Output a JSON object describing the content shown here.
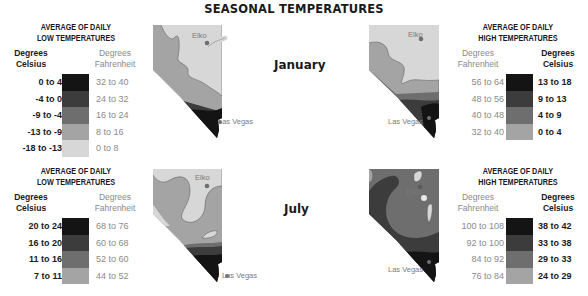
{
  "title": "SEASONAL TEMPERATURES",
  "months": {
    "january": "January",
    "july": "July"
  },
  "cities": {
    "elko": "Elko",
    "las_vegas": "Las Vegas"
  },
  "colors": {
    "level1": "#141414",
    "level2": "#3c3c3c",
    "level3": "#6e6e6e",
    "level4": "#a4a4a4",
    "level5": "#d7d7d7"
  },
  "legends": {
    "jan_low": {
      "title_line1": "AVERAGE OF DAILY",
      "title_line2": "LOW TEMPERATURES",
      "celsius_head1": "Degrees",
      "celsius_head2": "Celsius",
      "fahr_head1": "Degrees",
      "fahr_head2": "Fahrenheit",
      "rows": [
        {
          "c": "0 to 4",
          "f": "32 to 40",
          "color": "#141414"
        },
        {
          "c": "-4 to 0",
          "f": "24 to 32",
          "color": "#3c3c3c"
        },
        {
          "c": "-9 to -4",
          "f": "16 to 24",
          "color": "#6e6e6e"
        },
        {
          "c": "-13 to -9",
          "f": "8 to 16",
          "color": "#a4a4a4"
        },
        {
          "c": "-18 to -13",
          "f": "0 to 8",
          "color": "#d7d7d7"
        }
      ]
    },
    "jan_high": {
      "title_line1": "AVERAGE OF DAILY",
      "title_line2": "HIGH TEMPERATURES",
      "celsius_head1": "Degrees",
      "celsius_head2": "Celsius",
      "fahr_head1": "Degrees",
      "fahr_head2": "Fahrenheit",
      "rows": [
        {
          "c": "13 to 18",
          "f": "56 to 64",
          "color": "#141414"
        },
        {
          "c": "9 to 13",
          "f": "48 to 56",
          "color": "#3c3c3c"
        },
        {
          "c": "4 to 9",
          "f": "40 to 48",
          "color": "#6e6e6e"
        },
        {
          "c": "0 to 4",
          "f": "32 to 40",
          "color": "#a4a4a4"
        }
      ]
    },
    "jul_low": {
      "title_line1": "AVERAGE OF DAILY",
      "title_line2": "LOW TEMPERATURES",
      "celsius_head1": "Degrees",
      "celsius_head2": "Celsius",
      "fahr_head1": "Degrees",
      "fahr_head2": "Fahrenheit",
      "rows": [
        {
          "c": "20 to 24",
          "f": "68 to 76",
          "color": "#141414"
        },
        {
          "c": "16 to 20",
          "f": "60 to 68",
          "color": "#3c3c3c"
        },
        {
          "c": "11 to 16",
          "f": "52 to 60",
          "color": "#6e6e6e"
        },
        {
          "c": "7 to 11",
          "f": "44 to 52",
          "color": "#a4a4a4"
        }
      ]
    },
    "jul_high": {
      "title_line1": "AVERAGE OF DAILY",
      "title_line2": "HIGH TEMPERATURES",
      "celsius_head1": "Degrees",
      "celsius_head2": "Celsius",
      "fahr_head1": "Degrees",
      "fahr_head2": "Fahrenheit",
      "rows": [
        {
          "c": "38 to 42",
          "f": "100 to 108",
          "color": "#141414"
        },
        {
          "c": "33 to 38",
          "f": "92 to 100",
          "color": "#3c3c3c"
        },
        {
          "c": "29 to 33",
          "f": "84 to 92",
          "color": "#6e6e6e"
        },
        {
          "c": "24 to 29",
          "f": "76 to 84",
          "color": "#a4a4a4"
        }
      ]
    }
  }
}
